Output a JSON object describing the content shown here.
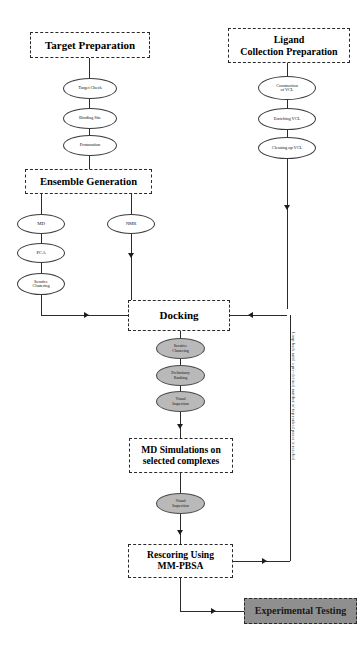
{
  "diagram": {
    "colors": {
      "line": "#2b2b2b",
      "stage_border": "#2a2a2a",
      "node_fill": "#ffffff",
      "node_gray_fill": "#b9b9b9",
      "experimental_fill": "#8f8f8f",
      "background": "#ffffff"
    }
  },
  "stages": {
    "target_preparation": "Target Preparation",
    "ligand_collection_preparation_line1": "Ligand",
    "ligand_collection_preparation_line2": "Collection Preparation",
    "ensemble_generation": "Ensemble Generation",
    "docking": "Docking",
    "md_simulations_line1": "MD Simulations on",
    "md_simulations_line2": "selected complexes",
    "rescoring_line1": "Rescoring Using",
    "rescoring_line2": "MM-PBSA",
    "experimental_testing": "Experimental Testing"
  },
  "nodes": {
    "target_check": "Target Check",
    "binding_site": "Binding Site",
    "protonation": "Protonation",
    "construction_of_vcl_line1": "Construction",
    "construction_of_vcl_line2": "of VCL",
    "enriching_vcl": "Enriching VCL",
    "cleaning_up_vcl": "Cleaning up VCL",
    "md": "MD",
    "pca": "PCA",
    "iterative_clustering_line1": "Iterative",
    "iterative_clustering_line2": "Clustering",
    "nmr": "NMR",
    "docking_clustering_line1": "Iterative",
    "docking_clustering_line2": "Clustering",
    "preliminary_ranking_line1": "Preliminary",
    "preliminary_ranking_line2": "Ranking",
    "visual_inspection_docking_line1": "Visual",
    "visual_inspection_docking_line2": "Inspection",
    "visual_inspection_md_line1": "Visual",
    "visual_inspection_md_line2": "Inspection"
  },
  "annotations": {
    "feedback_loop_label": "Loop back until a pre-defined number of top ranked poses is reached"
  }
}
